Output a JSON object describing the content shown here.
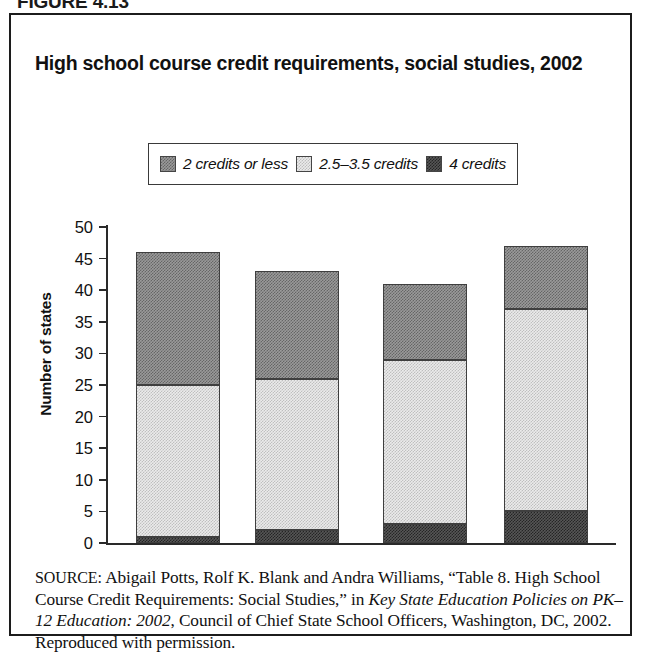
{
  "figure": {
    "label": "FIGURE 4.13"
  },
  "chart_title": "High school course credit requirements, social studies, 2002",
  "legend": {
    "items": [
      {
        "label": "2 credits or less",
        "swatch": "medium-gray-checker-swatch",
        "color": "#9a9a9a"
      },
      {
        "label": "2.5–3.5 credits",
        "swatch": "light-gray-checker-swatch",
        "color": "#ebebeb"
      },
      {
        "label": "4 credits",
        "swatch": "dark-gray-checker-swatch",
        "color": "#565656"
      }
    ]
  },
  "axis": {
    "y_title": "Number of states",
    "y_ticks": [
      "50",
      "45",
      "40",
      "35",
      "30",
      "25",
      "20",
      "15",
      "10",
      "5",
      "0"
    ]
  },
  "source": {
    "label": "SOURCE:",
    "text_1": " Abigail Potts, Rolf K. Blank and Andra Williams, “Table 8. High School Course Credit Requirements: Social Studies,” in ",
    "italic_1": "Key State Education Policies on PK–12 Education: 2002",
    "text_2": ", Council of Chief State School Officers, Washington, DC, 2002. Reproduced with permission."
  },
  "chart_data": {
    "type": "bar",
    "subtype": "stacked",
    "title": "High school course credit requirements, social studies, 2002",
    "xlabel": "",
    "ylabel": "Number of states",
    "ylim": [
      0,
      50
    ],
    "ytick_step": 5,
    "grid": false,
    "legend_position": "top-center",
    "categories": [
      "Group 1",
      "Group 2",
      "Group 3",
      "Group 4"
    ],
    "category_labels_shown": false,
    "series": [
      {
        "name": "4 credits",
        "values": [
          1,
          2,
          3,
          5
        ],
        "color": "#565656"
      },
      {
        "name": "2.5–3.5 credits",
        "values": [
          24,
          24,
          26,
          32
        ],
        "color": "#ebebeb"
      },
      {
        "name": "2 credits or less",
        "values": [
          21,
          17,
          12,
          10
        ],
        "color": "#9a9a9a"
      }
    ],
    "stack_tops": [
      46,
      43,
      41,
      47.5
    ],
    "stack_boundaries_lower": [
      1,
      2,
      3,
      5
    ],
    "stack_boundaries_upper": [
      25,
      26,
      29,
      37
    ]
  }
}
